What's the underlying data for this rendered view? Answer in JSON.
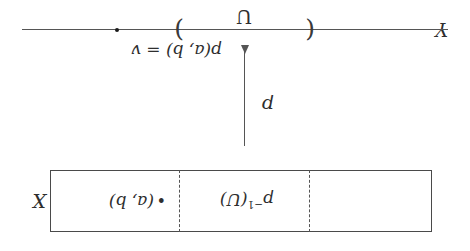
{
  "figure": {
    "ink_color": "#2e2e2e",
    "line_color": "#555555",
    "background": "#ffffff",
    "orientation": "rotated-180"
  },
  "codomain": {
    "axis_label": "Y",
    "point_label": "p(a, b) = v",
    "interval_label": "U",
    "interval_open_delimiter": "(",
    "interval_close_delimiter": ")"
  },
  "map": {
    "arrow_label": "p",
    "arrow_direction": "down"
  },
  "domain": {
    "axis_label": "X",
    "point_marker": "•",
    "point_label": "(a, b)",
    "preimage_base": "p",
    "preimage_exponent": "−1",
    "preimage_argument": "(U)"
  }
}
